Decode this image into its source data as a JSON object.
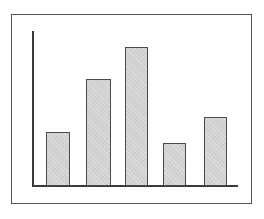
{
  "figure": {
    "title": "",
    "background_color": "#ffffff",
    "frame_color": "#555555",
    "axis_color": "#3a3a3a"
  },
  "chart_data": {
    "type": "bar",
    "title": "",
    "subtitle": "",
    "xlabel": "",
    "ylabel": "",
    "categories": [
      "1",
      "2",
      "3",
      "4",
      "5"
    ],
    "values": [
      54,
      107,
      139,
      43,
      69
    ],
    "ylim": [
      0,
      155
    ],
    "xlim": [
      0,
      206
    ],
    "grid": false,
    "legend": false,
    "legend_position": "none",
    "tick_labels_x": [],
    "tick_labels_y": [],
    "annotations": [],
    "series": [
      {
        "name": "series-1",
        "values": [
          54,
          107,
          139,
          43,
          69
        ],
        "bar_fill_color": "#cfcfcf",
        "bar_edge_color": "#4a4a4a"
      }
    ],
    "bar_geometry": [
      {
        "label": "1",
        "left": 34,
        "width": 24,
        "top": 117,
        "height": 54
      },
      {
        "label": "2",
        "left": 74,
        "width": 25,
        "top": 64,
        "height": 107
      },
      {
        "label": "3",
        "left": 113,
        "width": 23,
        "top": 32,
        "height": 139
      },
      {
        "label": "4",
        "left": 151,
        "width": 23,
        "top": 128,
        "height": 43
      },
      {
        "label": "5",
        "left": 192,
        "width": 23,
        "top": 102,
        "height": 69
      }
    ]
  }
}
